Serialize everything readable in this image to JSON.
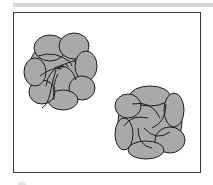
{
  "figure": {
    "colors": {
      "fill": "#a9a9a9",
      "outline": "#1e1e1e",
      "frame": "#3a3a3a",
      "band": "#d4d4d4",
      "background": "#ffffff"
    },
    "rosettes": [
      {
        "name": "rosette-being-stitched",
        "cx": 60,
        "cy": 72,
        "r": 33,
        "petals": 8,
        "has_thread": true
      },
      {
        "name": "rosette-finished",
        "cx": 150,
        "cy": 122,
        "r": 33,
        "petals": 6,
        "has_thread": false
      }
    ]
  }
}
